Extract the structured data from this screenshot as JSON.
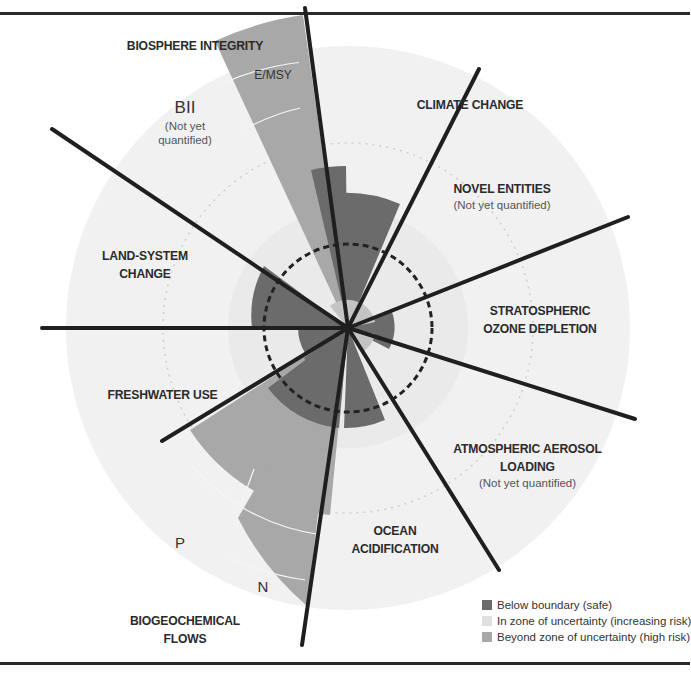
{
  "diagram": {
    "boundaries": [
      {
        "id": "climate-change",
        "label": "CLIMATE CHANGE",
        "status": "uncertainty"
      },
      {
        "id": "novel-entities",
        "label": "NOVEL ENTITIES",
        "note": "(Not yet quantified)",
        "status": "not-quantified"
      },
      {
        "id": "ozone",
        "label_line1": "STRATOSPHERIC",
        "label_line2": "OZONE DEPLETION",
        "status": "safe"
      },
      {
        "id": "aerosol",
        "label_line1": "ATMOSPHERIC AEROSOL",
        "label_line2": "LOADING",
        "note": "(Not yet quantified)",
        "status": "not-quantified"
      },
      {
        "id": "ocean",
        "label_line1": "OCEAN",
        "label_line2": "ACIDIFICATION",
        "status": "safe"
      },
      {
        "id": "biogeochemical",
        "label_line1": "BIOGEOCHEMICAL",
        "label_line2": "FLOWS",
        "sub_p": "P",
        "sub_n": "N",
        "status": "high-risk"
      },
      {
        "id": "freshwater",
        "label": "FRESHWATER USE",
        "status": "safe"
      },
      {
        "id": "land-system",
        "label_line1": "LAND-SYSTEM",
        "label_line2": "CHANGE",
        "status": "uncertainty"
      },
      {
        "id": "biosphere",
        "label": "BIOSPHERE INTEGRITY",
        "sub_emsy": "E/MSY",
        "sub_bii": "BII",
        "bii_note_line1": "(Not yet",
        "bii_note_line2": "quantified)",
        "status": "high-risk"
      }
    ]
  },
  "legend": {
    "items": [
      {
        "label": "Below boundary (safe)",
        "color": "#6b6b6b"
      },
      {
        "label": "In zone of uncertainty (increasing risk)",
        "color": "#dcdcdc"
      },
      {
        "label": "Beyond zone of uncertainty (high risk)",
        "color": "#a6a6a6"
      }
    ]
  },
  "colors": {
    "safe": "#6b6b6b",
    "uncertainty": "#d9d9d9",
    "high_risk": "#a8a8a8",
    "globe": "#efefef",
    "rule": "#2a2a2a"
  }
}
